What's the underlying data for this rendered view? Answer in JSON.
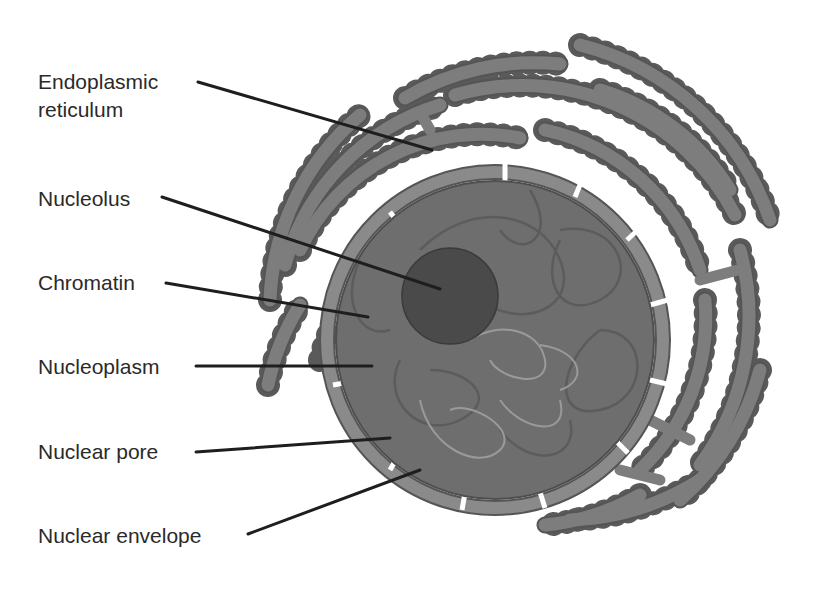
{
  "diagram": {
    "type": "labeled-illustration",
    "colors": {
      "background": "#ffffff",
      "er_fill": "#7d7d7d",
      "er_outline": "#555555",
      "ribosome": "#5a5a5a",
      "envelope": "#8a8a8a",
      "nucleoplasm": "#6e6e6e",
      "nucleolus": "#4a4a4a",
      "chromatin_dark": "#5e5e5e",
      "chromatin_light": "#9a9a9a",
      "leader_line": "#1e1e1e",
      "label_text": "#2a2a2a"
    },
    "labels": [
      {
        "id": "er",
        "text_line1": "Endoplasmic",
        "text_line2": "reticulum"
      },
      {
        "id": "nucleolus",
        "text_line1": "Nucleolus"
      },
      {
        "id": "chromatin",
        "text_line1": "Chromatin"
      },
      {
        "id": "nucleoplasm",
        "text_line1": "Nucleoplasm"
      },
      {
        "id": "nuclear_pore",
        "text_line1": "Nuclear pore"
      },
      {
        "id": "nuclear_envelope",
        "text_line1": "Nuclear envelope"
      }
    ]
  }
}
